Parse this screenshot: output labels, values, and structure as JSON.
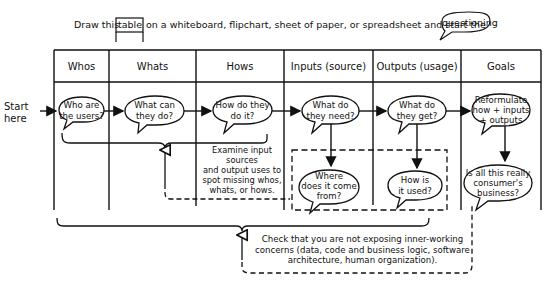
{
  "instruction": {
    "prefix": "Draw this",
    "table_word": "table",
    "middle": "on a whiteboard, flipchart, sheet of paper, or spreadsheet and start the",
    "questioning_word": "questioning"
  },
  "table": {
    "columns": [
      "Whos",
      "Whats",
      "Hows",
      "Inputs (source)",
      "Outputs (usage)",
      "Goals"
    ]
  },
  "start_label": [
    "Start",
    "here"
  ],
  "bubbles": {
    "whos": [
      "Who are",
      "the users?"
    ],
    "whats": [
      "What can",
      "they do?"
    ],
    "hows": [
      "How do they",
      "do it?"
    ],
    "inputs": [
      "What do",
      "they need?"
    ],
    "outputs": [
      "What do",
      "they get?"
    ],
    "goals": [
      "Reformulate",
      "how + inputs",
      "+ outputs"
    ],
    "inputs_followup": [
      "Where",
      "does it come",
      "from?"
    ],
    "outputs_followup": [
      "How is",
      "it used?"
    ],
    "goals_followup": [
      "Is all this really",
      "consumer's",
      "business?"
    ]
  },
  "notes": {
    "examine": [
      "Examine input sources",
      "and output uses to",
      "spot missing whos,",
      "whats, or hows."
    ],
    "check": [
      "Check that you are not exposing inner-working",
      "concerns (data, code and business logic, software",
      "architecture, human organization)."
    ]
  },
  "colors": {
    "ink": "#111111",
    "background": "#ffffff"
  }
}
